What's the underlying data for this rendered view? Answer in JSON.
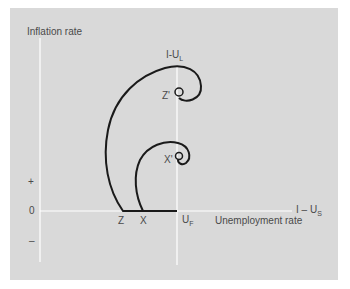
{
  "diagram": {
    "y_axis_label": "Inflation rate",
    "x_axis_label": "Unemployment rate",
    "vertical_line_label": {
      "main": "I-U",
      "sub": "L"
    },
    "horizontal_line_label": {
      "main": "I – U",
      "sub": "S"
    },
    "y_ticks": {
      "plus": "+",
      "zero": "0",
      "minus": "–"
    },
    "points": {
      "z": "Z",
      "x": "X",
      "uf_main": "U",
      "uf_sub": "F",
      "z_prime": "Z'",
      "x_prime": "X'"
    },
    "colors": {
      "background": "#d9d9d9",
      "axis": "#ffffff",
      "curve": "#1a1a1a",
      "text": "#4a4a4a"
    }
  }
}
